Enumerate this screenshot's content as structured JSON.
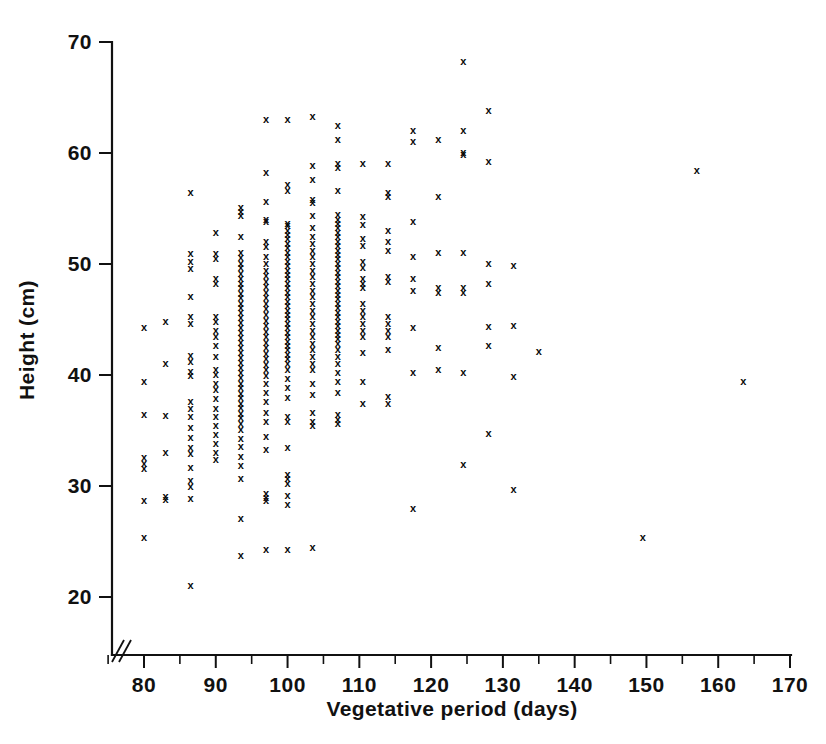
{
  "chart_data": {
    "type": "scatter",
    "title": "",
    "xlabel": "Vegetative period (days)",
    "ylabel": "Height (cm)",
    "xlim": [
      72,
      170
    ],
    "ylim": [
      16.5,
      70
    ],
    "grid": false,
    "legend": null,
    "marker_symbol": "x",
    "marker_color": "#0a0a0a",
    "axis_break": "x-axis broken between origin and first tick",
    "xticks": [
      80,
      90,
      100,
      110,
      120,
      130,
      140,
      150,
      160,
      170
    ],
    "xtick_labels": [
      "80",
      "90",
      "100",
      "110",
      "120",
      "130",
      "140",
      "150",
      "160",
      "170"
    ],
    "xminor_ticks": [
      75,
      85,
      95,
      105,
      115,
      125,
      135,
      145,
      155,
      165
    ],
    "yticks": [
      20,
      30,
      40,
      50,
      60,
      70
    ],
    "ytick_labels": [
      "20",
      "30",
      "40",
      "50",
      "60",
      "70"
    ],
    "columns": [
      {
        "x": 80,
        "values": [
          44.2,
          39.4,
          36.4,
          32.5,
          32.0,
          31.5,
          28.6,
          25.3
        ]
      },
      {
        "x": 83,
        "values": [
          44.8,
          41.0,
          36.3,
          33.0,
          29.0,
          28.7
        ]
      },
      {
        "x": 86.5,
        "values": [
          56.4,
          50.9,
          50.2,
          49.5,
          47.0,
          45.2,
          44.6,
          41.7,
          41.2,
          40.3,
          39.9,
          37.6,
          36.9,
          36.2,
          35.2,
          34.3,
          33.4,
          32.9,
          31.6,
          30.4,
          29.9,
          28.8,
          21.0
        ]
      },
      {
        "x": 90,
        "values": [
          52.8,
          50.9,
          50.4,
          48.6,
          48.2,
          45.2,
          44.8,
          44.0,
          43.4,
          42.6,
          41.6,
          40.4,
          40.0,
          39.2,
          38.6,
          37.8,
          36.9,
          36.2,
          35.4,
          34.6,
          33.8,
          33.0,
          32.3
        ]
      },
      {
        "x": 93.5,
        "values": [
          55.0,
          54.7,
          54.3,
          52.4,
          51.0,
          50.5,
          50.0,
          49.6,
          49.1,
          48.6,
          48.2,
          47.8,
          47.3,
          46.9,
          46.4,
          46.0,
          45.6,
          45.1,
          44.7,
          44.2,
          43.8,
          43.3,
          42.9,
          42.4,
          42.0,
          41.5,
          41.1,
          40.6,
          40.2,
          39.7,
          39.2,
          38.8,
          38.3,
          37.9,
          37.4,
          37.0,
          36.5,
          36.1,
          35.6,
          35.0,
          34.2,
          33.5,
          32.6,
          31.8,
          30.6,
          27.0,
          23.7
        ]
      },
      {
        "x": 97,
        "values": [
          63.0,
          58.2,
          55.6,
          54.0,
          53.8,
          52.0,
          51.5,
          50.6,
          50.0,
          49.4,
          48.9,
          48.4,
          47.9,
          47.4,
          46.9,
          46.4,
          45.9,
          45.4,
          44.9,
          44.4,
          43.9,
          43.4,
          42.9,
          42.4,
          41.9,
          41.4,
          40.9,
          40.4,
          39.9,
          39.2,
          38.4,
          37.6,
          36.6,
          35.8,
          34.4,
          33.2,
          29.3,
          28.9,
          28.6,
          24.2
        ]
      },
      {
        "x": 100,
        "values": [
          63.0,
          57.1,
          56.6,
          53.6,
          53.4,
          53.0,
          52.6,
          52.2,
          51.8,
          51.4,
          51.0,
          50.6,
          50.2,
          49.8,
          49.4,
          49.0,
          48.6,
          48.2,
          47.8,
          47.4,
          47.0,
          46.6,
          46.2,
          45.8,
          45.4,
          45.0,
          44.6,
          44.2,
          43.8,
          43.4,
          43.0,
          42.6,
          42.2,
          41.8,
          41.4,
          41.0,
          40.4,
          39.6,
          38.8,
          37.9,
          36.2,
          35.8,
          33.4,
          31.0,
          30.6,
          30.2,
          29.1,
          28.3,
          24.2
        ]
      },
      {
        "x": 103.5,
        "values": [
          63.2,
          58.8,
          57.6,
          55.8,
          55.5,
          54.3,
          53.2,
          52.4,
          51.8,
          51.2,
          50.6,
          50.0,
          49.4,
          48.8,
          48.2,
          47.6,
          47.0,
          46.4,
          45.8,
          45.2,
          44.6,
          44.0,
          43.4,
          42.8,
          42.2,
          41.6,
          41.0,
          40.4,
          39.2,
          38.2,
          36.6,
          35.8,
          35.4,
          24.4
        ]
      },
      {
        "x": 107,
        "values": [
          62.4,
          61.2,
          59.0,
          58.6,
          56.6,
          54.4,
          54.0,
          53.6,
          53.2,
          52.8,
          52.4,
          52.0,
          51.6,
          51.2,
          50.8,
          50.4,
          50.0,
          49.6,
          49.2,
          48.8,
          48.4,
          48.0,
          47.6,
          47.2,
          46.8,
          46.4,
          46.0,
          45.6,
          45.2,
          44.8,
          44.4,
          44.0,
          43.6,
          43.2,
          42.8,
          42.2,
          41.6,
          41.0,
          40.2,
          39.4,
          38.4,
          36.4,
          35.9,
          35.6
        ]
      },
      {
        "x": 110.5,
        "values": [
          59.0,
          54.2,
          53.5,
          52.2,
          51.6,
          50.2,
          49.6,
          48.6,
          48.2,
          47.8,
          46.4,
          45.8,
          45.2,
          44.6,
          44.0,
          43.4,
          42.0,
          39.4,
          37.4
        ]
      },
      {
        "x": 114,
        "values": [
          59.0,
          56.4,
          56.0,
          53.0,
          52.0,
          51.2,
          48.8,
          48.4,
          45.2,
          44.6,
          44.0,
          43.4,
          42.2,
          38.0,
          37.4
        ]
      },
      {
        "x": 117.5,
        "values": [
          62.0,
          61.0,
          53.8,
          50.6,
          48.6,
          47.6,
          44.2,
          40.2,
          27.9
        ]
      },
      {
        "x": 121,
        "values": [
          61.2,
          56.0,
          51.0,
          47.8,
          47.4,
          42.4,
          40.4
        ]
      },
      {
        "x": 124.5,
        "values": [
          68.2,
          62.0,
          60.0,
          59.8,
          51.0,
          47.8,
          47.4,
          40.2,
          31.9
        ]
      },
      {
        "x": 128,
        "values": [
          63.8,
          59.2,
          50.0,
          48.2,
          44.3,
          42.6,
          34.7
        ]
      },
      {
        "x": 131.5,
        "values": [
          49.8,
          44.4,
          39.8,
          29.6
        ]
      },
      {
        "x": 135,
        "values": [
          42.1
        ]
      },
      {
        "x": 149.5,
        "values": [
          25.3
        ]
      },
      {
        "x": 157,
        "values": [
          58.4
        ]
      },
      {
        "x": 163.5,
        "values": [
          39.4
        ]
      }
    ]
  },
  "axes": {
    "x_label": "Vegetative period (days)",
    "y_label": "Height (cm)"
  }
}
